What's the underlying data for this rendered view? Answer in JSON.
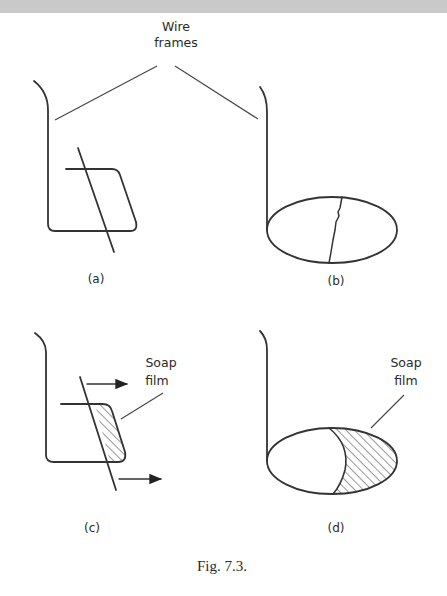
{
  "figure": {
    "caption": "Fig. 7.3.",
    "callouts": {
      "wire_frames": {
        "line1": "Wire",
        "line2": "frames"
      },
      "soap_film_c": {
        "line1": "Soap",
        "line2": "film"
      },
      "soap_film_d": {
        "line1": "Soap",
        "line2": "film"
      }
    },
    "panels": [
      {
        "id": "a",
        "label": "(a)",
        "description": "Rectangular wire frame with sliding wire, no film"
      },
      {
        "id": "b",
        "label": "(b)",
        "description": "Elliptical wire loop with loose thread across it"
      },
      {
        "id": "c",
        "label": "(c)",
        "description": "Rectangular frame with soap film pulling slider; arrows show motion"
      },
      {
        "id": "d",
        "label": "(d)",
        "description": "Elliptical loop with soap film on one side; thread pulled into arc"
      }
    ],
    "colors": {
      "ink": "#333333",
      "band": "#c9c9c9",
      "background": "#ffffff"
    }
  }
}
